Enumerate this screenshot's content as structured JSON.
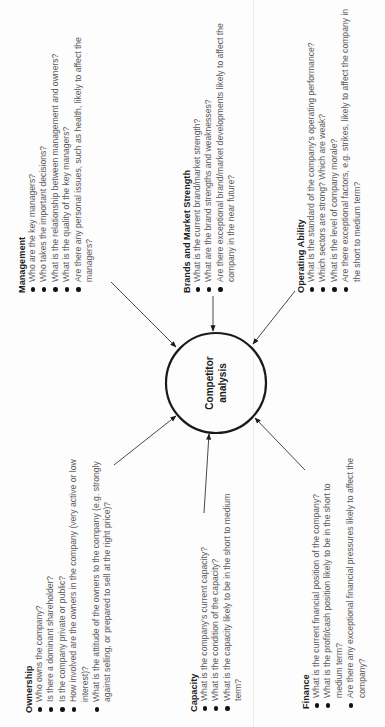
{
  "diagram": {
    "center": {
      "label_line1": "Competitor",
      "label_line2": "analysis"
    },
    "colors": {
      "stroke": "#1a1a1a",
      "body_text": "#5a5a5a",
      "heading_text": "#1e1e1e"
    },
    "orientation": "rotated 90 degrees counter-clockwise",
    "nodes": [
      {
        "id": "management",
        "title": "Management",
        "items": [
          "Who are the key managers?",
          "Who takes the important decisions?",
          "What is the relationship between management and owners?",
          "What is the quality of the key managers?",
          "Are there any personal issues, such as health, likely to affect the managers?"
        ]
      },
      {
        "id": "brands",
        "title": "Brands and Market Strength",
        "items": [
          "What is the current brand/market strength?",
          "What are the brand strengths and weaknesses?",
          "Are there exceptional brand/market developments likely to affect the company in the near future?"
        ]
      },
      {
        "id": "operating",
        "title": "Operating Ability",
        "items": [
          "What is the standard of the company's operating performance?",
          "Which sectors are strong? Which are weak?",
          "What is the level of company morale?",
          "Are there exceptional factors, e.g. strikes, likely to affect the company in the short to medium term?"
        ]
      },
      {
        "id": "ownership",
        "title": "Ownership",
        "items": [
          "Who owns the company?",
          "Is there a dominant shareholder?",
          "Is the company private or public?",
          "How involved are the owners in the company (very active or low interest)?",
          "What is the attitude of the owners to the company (e.g. strongly against selling, or prepared to sell at the right price)?"
        ]
      },
      {
        "id": "capacity",
        "title": "Capacity",
        "items": [
          "What is the company's current capacity?",
          "What is the condition of the capacity?",
          "What is the capacity likely to be in the short to medium term?"
        ]
      },
      {
        "id": "finance",
        "title": "Finance",
        "items": [
          "What is the current financial position of the company?",
          "What is the profit/cash position likely to be in the short to medium term?",
          "Are there any exceptional financial pressures likely to affect the company?"
        ]
      }
    ]
  }
}
